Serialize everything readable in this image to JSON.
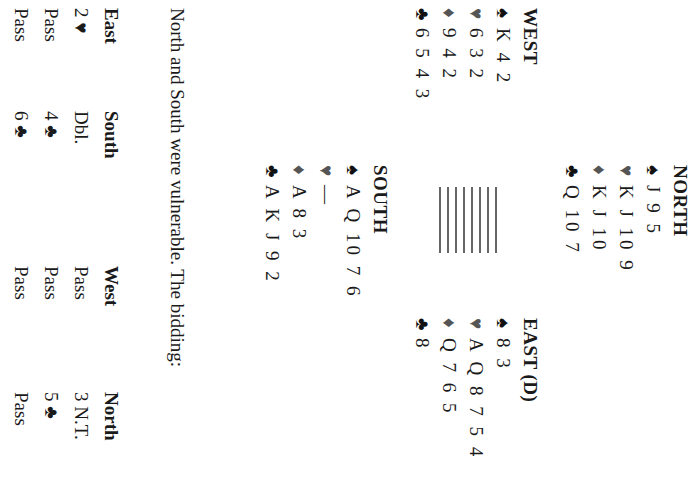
{
  "hands": {
    "north": {
      "title": "NORTH",
      "spades": "J 9 5",
      "hearts": "K J 10 9",
      "diamonds": "K J 10",
      "clubs": "Q 10 7"
    },
    "west": {
      "title": "WEST",
      "spades": "K 4 2",
      "hearts": "6 3 2",
      "diamonds": "9 4 2",
      "clubs": "6 5 4 3"
    },
    "east": {
      "title": "EAST (D)",
      "spades": "8 3",
      "hearts": "A Q 8 7 5 4",
      "diamonds": "Q 7 6 5",
      "clubs": "8"
    },
    "south": {
      "title": "SOUTH",
      "spades": "A Q 10 7 6",
      "hearts": "—",
      "diamonds": "A 8 3",
      "clubs": "A K J 9 2"
    }
  },
  "suits": {
    "spade": "♠",
    "heart": "♥",
    "diamond": "♦",
    "club": "♣"
  },
  "vulnerability_text": "North and South were vulnerable. The bidding:",
  "bidding": {
    "headers": [
      "East",
      "South",
      "West",
      "North"
    ],
    "rows": [
      [
        "2 ♥",
        "Dbl.",
        "Pass",
        "3 N.T."
      ],
      [
        "Pass",
        "4 ♣",
        "Pass",
        "5 ♣"
      ],
      [
        "Pass",
        "6 ♣",
        "Pass",
        "Pass"
      ]
    ]
  }
}
